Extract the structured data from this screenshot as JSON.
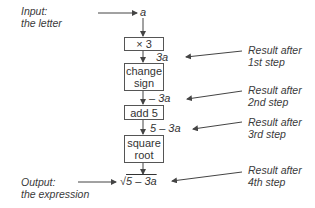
{
  "input": {
    "label_line1": "Input:",
    "label_line2": "the letter",
    "value": "a"
  },
  "steps": [
    {
      "box_line1": "× 3",
      "box_line2": "",
      "result": "3a",
      "result_prefix": "",
      "result_var": "3a",
      "note_line1": "Result after",
      "note_line2": "1st step"
    },
    {
      "box_line1": "change",
      "box_line2": "sign",
      "result": "– 3a",
      "note_line1": "Result after",
      "note_line2": "2nd step"
    },
    {
      "box_line1": "add 5",
      "box_line2": "",
      "result": "5 – 3a",
      "note_line1": "Result after",
      "note_line2": "3rd step"
    },
    {
      "box_line1": "square",
      "box_line2": "root",
      "result": "√5 – 3a",
      "note_line1": "Result after",
      "note_line2": "4th step"
    }
  ],
  "output": {
    "label_line1": "Output:",
    "label_line2": "the expression",
    "radical": "√",
    "radicand": "5 – 3a"
  },
  "colors": {
    "line": "#444444",
    "text": "#333333"
  }
}
